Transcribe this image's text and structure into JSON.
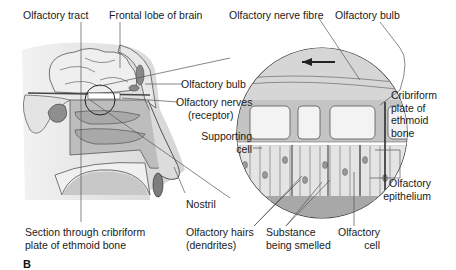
{
  "figure": {
    "panel_letter": "B",
    "labels": {
      "olfactory_tract": "Olfactory tract",
      "frontal_lobe": "Frontal lobe of brain",
      "olfactory_nerve_fibre": "Olfactory nerve fibre",
      "olfactory_bulb_top": "Olfactory bulb",
      "olfactory_bulb_left": "Olfactory bulb",
      "olfactory_nerves_1": "Olfactory nerves",
      "olfactory_nerves_2": "(receptor)",
      "cribriform_1": "Cribriform",
      "cribriform_2": "plate of",
      "cribriform_3": "ethmoid",
      "cribriform_4": "bone",
      "supporting_1": "Supporting",
      "supporting_2": "cell",
      "nostril": "Nostril",
      "olfactory_epithelium_1": "Olfactory",
      "olfactory_epithelium_2": "epithelium",
      "section_1": "Section through cribriform",
      "section_2": "plate of ethmoid bone",
      "hairs_1": "Olfactory hairs",
      "hairs_2": "(dendrites)",
      "substance_1": "Substance",
      "substance_2": "being smelled",
      "olfactory_cell_1": "Olfactory",
      "olfactory_cell_2": "cell"
    },
    "colors": {
      "line": "#333333",
      "light_gray": "#d8d8d8",
      "mid_gray": "#b5b5b5",
      "dark_gray": "#8a8a8a"
    }
  }
}
